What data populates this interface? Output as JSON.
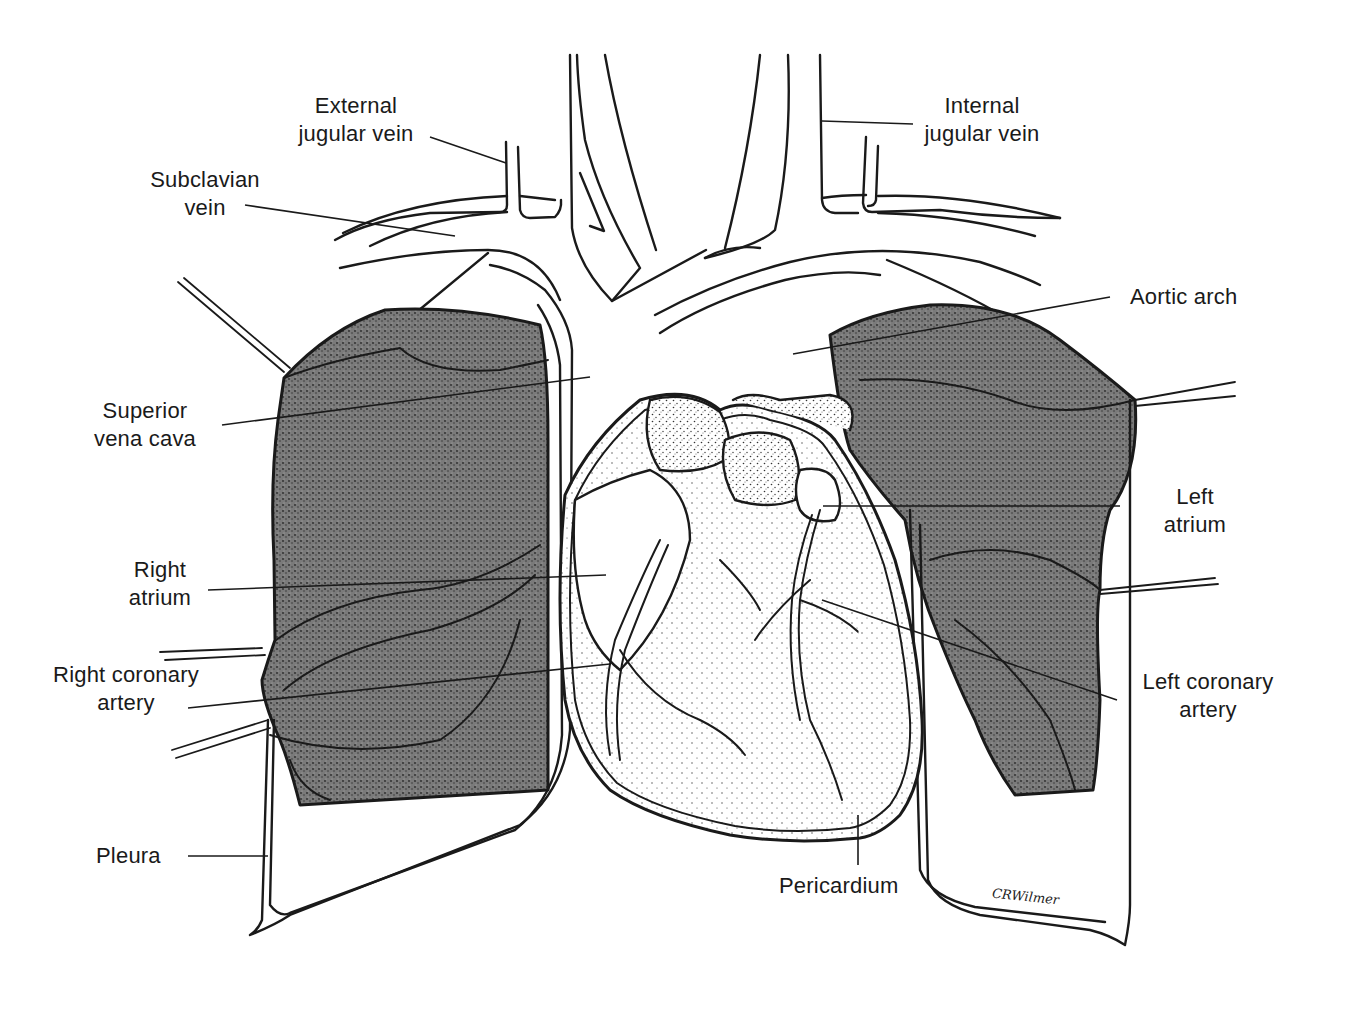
{
  "figure": {
    "signature": "CRWilmer",
    "colors": {
      "ink": "#1a1a1a",
      "lung_fill": "#5a5a5a",
      "stipple": "#8a8a8a",
      "background": "#ffffff"
    }
  },
  "labels": {
    "external_jugular_vein": {
      "line1": "External",
      "line2": "jugular vein"
    },
    "internal_jugular_vein": {
      "line1": "Internal",
      "line2": "jugular vein"
    },
    "subclavian_vein": {
      "line1": "Subclavian",
      "line2": "vein"
    },
    "aortic_arch": {
      "line1": "Aortic arch"
    },
    "superior_vena_cava": {
      "line1": "Superior",
      "line2": "vena cava"
    },
    "left_atrium": {
      "line1": "Left",
      "line2": "atrium"
    },
    "right_atrium": {
      "line1": "Right",
      "line2": "atrium"
    },
    "right_coronary_artery": {
      "line1": "Right coronary",
      "line2": "artery"
    },
    "left_coronary_artery": {
      "line1": "Left coronary",
      "line2": "artery"
    },
    "pleura": {
      "line1": "Pleura"
    },
    "pericardium": {
      "line1": "Pericardium"
    }
  }
}
